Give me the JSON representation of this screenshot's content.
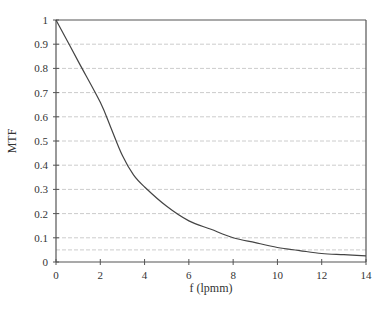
{
  "chart_data": {
    "type": "line",
    "title": "",
    "xlabel": "f (lpmm)",
    "ylabel": "MTF",
    "xlim": [
      0,
      14
    ],
    "ylim": [
      0,
      1
    ],
    "x_ticks": [
      0,
      2,
      4,
      6,
      8,
      10,
      12,
      14
    ],
    "y_ticks": [
      0,
      0.1,
      0.2,
      0.3,
      0.4,
      0.5,
      0.6,
      0.7,
      0.8,
      0.9,
      1
    ],
    "y_tick_labels": [
      "0",
      "0.1",
      "0.2",
      "0.3",
      "0.4",
      "0.5",
      "0.6",
      "0.7",
      "0.8",
      "0.9",
      "1"
    ],
    "grid": "horizontal dashed",
    "extra_gridlines": [
      0.05
    ],
    "legend": null,
    "series": [
      {
        "name": "MTF",
        "x": [
          0,
          1,
          2,
          2.5,
          3,
          3.5,
          4,
          5,
          6,
          7,
          8,
          9,
          10,
          11,
          12,
          13,
          14
        ],
        "values": [
          1.0,
          0.83,
          0.66,
          0.55,
          0.44,
          0.36,
          0.31,
          0.23,
          0.17,
          0.135,
          0.1,
          0.08,
          0.06,
          0.047,
          0.035,
          0.03,
          0.025
        ]
      }
    ],
    "colors": {
      "line": "#444444",
      "axis": "#555555",
      "grid": "#cccccc"
    }
  }
}
